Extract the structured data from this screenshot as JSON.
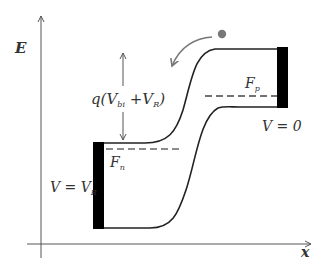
{
  "diagram": {
    "axes": {
      "y_label": "E",
      "x_label": "x"
    },
    "labels": {
      "barrier_prefix": "q(",
      "barrier_v1": "V",
      "barrier_v1_sub": "bi",
      "barrier_plus": " +",
      "barrier_v2": "V",
      "barrier_v2_sub": "R",
      "barrier_suffix": ")",
      "fn": "F",
      "fn_sub": "n",
      "fp": "F",
      "fp_sub": "p",
      "left_voltage_prefix": "V = V",
      "left_voltage_sub": "R",
      "right_voltage": "V = 0"
    },
    "elements": [
      "conduction-band-curve",
      "valence-band-curve",
      "quasi-fermi-level-n (dashed)",
      "quasi-fermi-level-p (dashed)",
      "left-contact",
      "right-contact",
      "barrier-height-double-arrow",
      "electron-dot",
      "electron-drift-curved-arrow"
    ],
    "colors": {
      "lines": "#222222",
      "axis": "#555555",
      "dashed": "#555555",
      "contact": "#000000",
      "electron": "#777777",
      "arrow": "#777777"
    }
  }
}
